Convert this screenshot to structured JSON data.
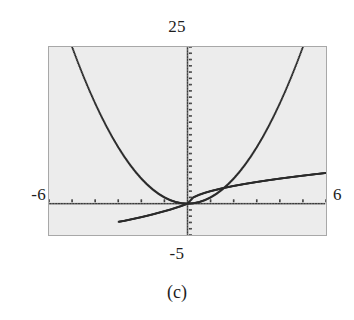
{
  "figure": {
    "caption": "(c)",
    "window_labels": {
      "ymax": "25",
      "ymin": "-5",
      "xmin": "-6",
      "xmax": "6"
    },
    "colors": {
      "screen_background": "#ececec",
      "screen_border": "#a8a8a8",
      "plot_ink": "#2b2b2b",
      "axis_ink": "#3a3a3a",
      "text": "#1d1d1d",
      "page_background": "#ffffff"
    }
  },
  "chart_data": {
    "type": "line",
    "title": "",
    "subtitle": "",
    "xlabel": "",
    "ylabel": "",
    "xlim": [
      -6,
      6
    ],
    "ylim": [
      -5,
      25
    ],
    "grid": false,
    "legend": "none",
    "render_style": "dotted-pixel",
    "axes": {
      "x_axis_y": 0,
      "y_axis_x": 0,
      "x_tick_spacing": 1,
      "y_tick_spacing": 1,
      "tick_style": "short-marks-on-axis"
    },
    "annotations": [
      {
        "text": "25",
        "position": "above-screen-center",
        "meaning": "Ymax"
      },
      {
        "text": "-5",
        "position": "below-screen-center",
        "meaning": "Ymin"
      },
      {
        "text": "-6",
        "position": "left-of-screen",
        "meaning": "Xmin"
      },
      {
        "text": "6",
        "position": "right-of-screen",
        "meaning": "Xmax"
      },
      {
        "text": "(c)",
        "position": "figure-caption",
        "meaning": "part label"
      }
    ],
    "series": [
      {
        "name": "parabola",
        "expression": "y = x^2",
        "x": [
          -5.0,
          -4.75,
          -4.5,
          -4.25,
          -4.0,
          -3.75,
          -3.5,
          -3.25,
          -3.0,
          -2.75,
          -2.5,
          -2.25,
          -2.0,
          -1.75,
          -1.5,
          -1.25,
          -1.0,
          -0.75,
          -0.5,
          -0.25,
          0.0,
          0.25,
          0.5,
          0.75,
          1.0,
          1.25,
          1.5,
          1.75,
          2.0,
          2.25,
          2.5,
          2.75,
          3.0,
          3.25,
          3.5,
          3.75,
          4.0,
          4.25,
          4.5,
          4.75,
          5.0
        ],
        "values": [
          25.0,
          22.5625,
          20.25,
          18.0625,
          16.0,
          14.0625,
          12.25,
          10.5625,
          9.0,
          7.5625,
          6.25,
          5.0625,
          4.0,
          3.0625,
          2.25,
          1.5625,
          1.0,
          0.5625,
          0.25,
          0.0625,
          0.0,
          0.0625,
          0.25,
          0.5625,
          1.0,
          1.5625,
          2.25,
          3.0625,
          4.0,
          5.0625,
          6.25,
          7.5625,
          9.0,
          10.5625,
          12.25,
          14.0625,
          16.0,
          18.0625,
          20.25,
          22.5625,
          25.0
        ]
      },
      {
        "name": "increasing-curve-right",
        "expression": "y = 2*sqrt(x) (x >= 0)",
        "x": [
          0.0,
          0.25,
          0.5,
          0.75,
          1.0,
          1.5,
          2.0,
          2.5,
          3.0,
          3.5,
          4.0,
          4.5,
          5.0,
          5.5,
          6.0
        ],
        "values": [
          0.0,
          1.0,
          1.41,
          1.73,
          2.0,
          2.45,
          2.83,
          3.16,
          3.46,
          3.74,
          4.0,
          4.24,
          4.47,
          4.69,
          4.9
        ]
      },
      {
        "name": "odd-curve-through-origin",
        "expression": "y = 2*x^(1/3)-like, lower-left to center",
        "x": [
          -3.0,
          -2.75,
          -2.5,
          -2.25,
          -2.0,
          -1.75,
          -1.5,
          -1.25,
          -1.0,
          -0.75,
          -0.5,
          -0.25,
          0.0
        ],
        "values": [
          -2.9,
          -2.75,
          -2.55,
          -2.35,
          -2.15,
          -1.93,
          -1.7,
          -1.45,
          -1.2,
          -0.95,
          -0.65,
          -0.35,
          0.0
        ]
      }
    ]
  }
}
